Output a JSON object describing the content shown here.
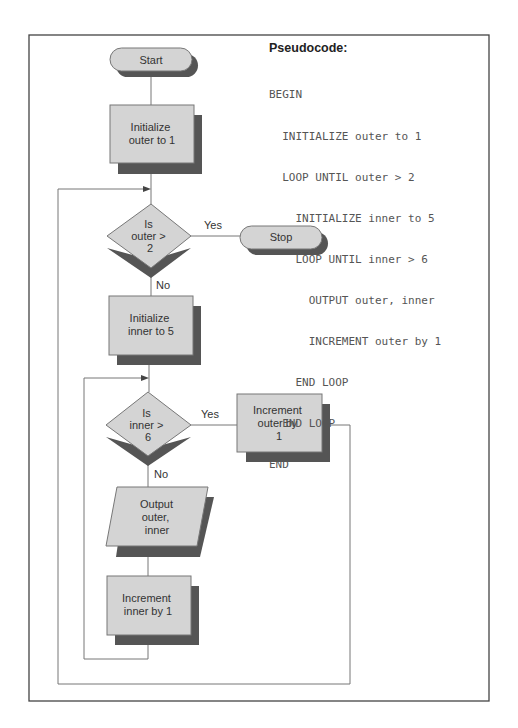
{
  "colors": {
    "frame": "#444444",
    "shape_fill": "#d4d4d4",
    "shape_stroke": "#777777",
    "shadow": "#555555",
    "line": "#777777",
    "text": "#333333",
    "code_text": "#555555"
  },
  "pseudocode": {
    "title": "Pseudocode:",
    "lines": [
      "BEGIN",
      "  INITIALIZE outer to 1",
      "  LOOP UNTIL outer > 2",
      "    INITIALIZE inner to 5",
      "    LOOP UNTIL inner > 6",
      "      OUTPUT outer, inner",
      "      INCREMENT outer by 1",
      "    END LOOP",
      "  END LOOP",
      "END"
    ]
  },
  "flowchart": {
    "start": {
      "label": "Start",
      "type": "terminal"
    },
    "init_outer": {
      "lines": [
        "Initialize",
        "outer to 1"
      ],
      "type": "process"
    },
    "decision_outer": {
      "lines": [
        "Is",
        "outer >",
        "2"
      ],
      "type": "decision",
      "yes_label": "Yes",
      "no_label": "No"
    },
    "stop": {
      "label": "Stop",
      "type": "terminal"
    },
    "init_inner": {
      "lines": [
        "Initialize",
        "inner to 5"
      ],
      "type": "process"
    },
    "decision_inner": {
      "lines": [
        "Is",
        "inner >",
        "6"
      ],
      "type": "decision",
      "yes_label": "Yes",
      "no_label": "No"
    },
    "increment_outer": {
      "lines": [
        "Increment",
        "outer by",
        "1"
      ],
      "type": "process"
    },
    "output": {
      "lines": [
        "Output",
        "outer,",
        "inner"
      ],
      "type": "io"
    },
    "increment_inner": {
      "lines": [
        "Increment",
        "inner by 1"
      ],
      "type": "process"
    }
  }
}
